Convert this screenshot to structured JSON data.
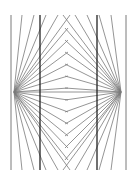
{
  "figure": {
    "type": "optical-illusion",
    "colors": {
      "background": "#ffffff",
      "ray": "#7a7a7a",
      "vertical": "#222222"
    },
    "left_center": [
      14,
      92
    ],
    "right_center": [
      121,
      92
    ],
    "dark_verticals_x": [
      40,
      97
    ],
    "light_verticals_x": [
      11,
      126
    ]
  }
}
